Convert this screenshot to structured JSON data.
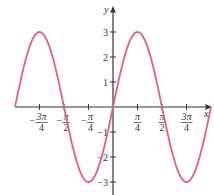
{
  "chart_data": {
    "type": "line",
    "title": "",
    "function": "y = 3 sin(2x)",
    "xlabel": "x",
    "ylabel": "y",
    "xlim": [
      -3.14159,
      3.14159
    ],
    "ylim": [
      -3.3,
      3.5
    ],
    "grid": false,
    "legend": null,
    "x_ticks": [
      {
        "value": -2.35619,
        "num": "3π",
        "den": "4",
        "sign": "−"
      },
      {
        "value": -1.5708,
        "num": "π",
        "den": "2",
        "sign": "−"
      },
      {
        "value": -0.7854,
        "num": "π",
        "den": "4",
        "sign": "−"
      },
      {
        "value": 0.7854,
        "num": "π",
        "den": "4",
        "sign": ""
      },
      {
        "value": 1.5708,
        "num": "π",
        "den": "2",
        "sign": ""
      },
      {
        "value": 2.35619,
        "num": "3π",
        "den": "4",
        "sign": ""
      }
    ],
    "y_ticks": [
      {
        "value": 3,
        "label": "3"
      },
      {
        "value": 2,
        "label": "2"
      },
      {
        "value": 1,
        "label": "1"
      },
      {
        "value": -1,
        "label": "−1"
      },
      {
        "value": -2,
        "label": "−2"
      },
      {
        "value": -3,
        "label": "−3"
      }
    ],
    "series": [
      {
        "name": "3 sin(2x)",
        "color": "#e0607e",
        "x": [
          -3.14159,
          -2.74889,
          -2.35619,
          -1.9635,
          -1.5708,
          -1.1781,
          -0.7854,
          -0.3927,
          0,
          0.3927,
          0.7854,
          1.1781,
          1.5708,
          1.9635,
          2.35619,
          2.74889,
          3.14159
        ],
        "y": [
          0,
          2.1213,
          3,
          2.1213,
          0,
          -2.1213,
          -3,
          -2.1213,
          0,
          2.1213,
          3,
          2.1213,
          0,
          -2.1213,
          -3,
          -2.1213,
          0
        ]
      }
    ]
  },
  "layout": {
    "origin_px": [
      113,
      107
    ],
    "px_per_x_unit": 31.2,
    "px_per_y_unit": 25,
    "axis_color": "#333333",
    "curve_color": "#e0607e"
  }
}
